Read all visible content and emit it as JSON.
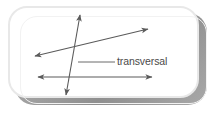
{
  "figure": {
    "kind": "geometry-diagram",
    "title_label": "transversal",
    "background_color": "#ffffff",
    "card": {
      "fill": "#ffffff",
      "border_color": "#e8e8e8",
      "shadow_color": "#9a9a9a",
      "corner_radius": 19,
      "x": 8,
      "y": 6,
      "width": 191,
      "height": 92
    },
    "stroke_color": "#5a5a5a",
    "leader_color": "#6a6a6a",
    "lines": [
      {
        "name": "parallel-line-upper",
        "style": "double-arrow",
        "x1": 35,
        "y1": 56,
        "x2": 148,
        "y2": 29
      },
      {
        "name": "parallel-line-lower",
        "style": "double-arrow",
        "x1": 38,
        "y1": 77,
        "x2": 152,
        "y2": 77
      },
      {
        "name": "transversal-line",
        "style": "double-arrow",
        "x1": 80,
        "y1": 15,
        "x2": 66,
        "y2": 95
      }
    ],
    "leader": {
      "name": "transversal-leader",
      "x1": 78,
      "y1": 62,
      "x2": 115,
      "y2": 62
    },
    "label": {
      "text": "transversal",
      "x": 117,
      "y": 55,
      "color": "#4a4a4a",
      "font_size": 10.5
    }
  }
}
